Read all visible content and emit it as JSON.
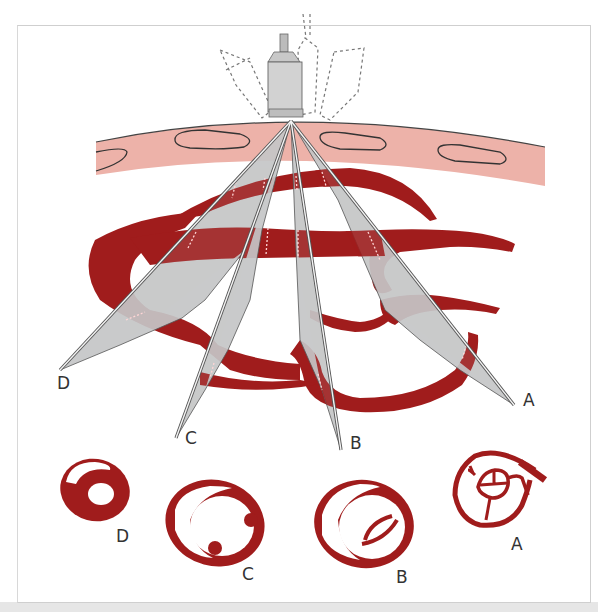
{
  "figure": {
    "colors": {
      "vessel": "#a01c1c",
      "skin": "#edb2a9",
      "beam": "#c4c5c7",
      "beam_edge": "#555555",
      "probe": "#cfcfcf",
      "frame_border": "#cfcfcf",
      "bottom_band": "#e6e6e6"
    },
    "scan_planes": [
      {
        "id": "A",
        "label": "A"
      },
      {
        "id": "B",
        "label": "B"
      },
      {
        "id": "C",
        "label": "C"
      },
      {
        "id": "D",
        "label": "D"
      }
    ],
    "cross_sections": [
      {
        "id": "D",
        "label": "D"
      },
      {
        "id": "C",
        "label": "C"
      },
      {
        "id": "B",
        "label": "B"
      },
      {
        "id": "A",
        "label": "A"
      }
    ]
  }
}
